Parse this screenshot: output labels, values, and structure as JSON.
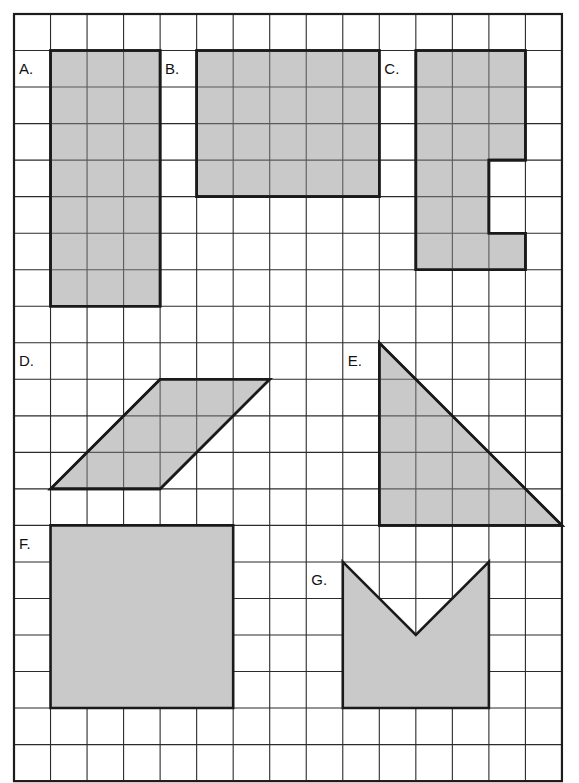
{
  "worksheet": {
    "title": "Area of shapes on a grid worksheet",
    "background_color": "#ffffff",
    "shape_fill_color": "#c9c9c9",
    "shape_stroke_color": "#1a1a1a",
    "grid_line_color": "#2b2b2b",
    "grid_border_color": "#1c1c1c"
  },
  "grid": {
    "origin_x": 14,
    "origin_y": 14,
    "cell_size": 36.53,
    "columns": 15,
    "rows": 21,
    "width": 548,
    "height": 767
  },
  "shapes": [
    {
      "id": "shape-a",
      "label": "A.",
      "label_cell": {
        "col": 0,
        "row": 1
      },
      "type": "rectangle",
      "description": "3 wide by 7 tall rectangle",
      "width_cells": 3,
      "height_cells": 7,
      "area_cells": 21,
      "show_inner_grid": true,
      "points": [
        [
          1,
          1
        ],
        [
          4,
          1
        ],
        [
          4,
          8
        ],
        [
          1,
          8
        ]
      ]
    },
    {
      "id": "shape-b",
      "label": "B.",
      "label_cell": {
        "col": 4,
        "row": 1
      },
      "type": "rectangle",
      "description": "5 wide by 4 tall rectangle",
      "width_cells": 5,
      "height_cells": 4,
      "area_cells": 20,
      "show_inner_grid": true,
      "points": [
        [
          5,
          1
        ],
        [
          10,
          1
        ],
        [
          10,
          5
        ],
        [
          5,
          5
        ]
      ]
    },
    {
      "id": "shape-c",
      "label": "C.",
      "label_cell": {
        "col": 10,
        "row": 1
      },
      "type": "polygon",
      "description": "C-shaped polygon, 3 wide, 6 tall with a notch on the right",
      "area_cells": 16,
      "show_inner_grid": true,
      "points": [
        [
          11,
          1
        ],
        [
          14,
          1
        ],
        [
          14,
          4
        ],
        [
          13,
          4
        ],
        [
          13,
          6
        ],
        [
          14,
          6
        ],
        [
          14,
          7
        ],
        [
          11,
          7
        ]
      ]
    },
    {
      "id": "shape-d",
      "label": "D.",
      "label_cell": {
        "col": 0,
        "row": 9
      },
      "type": "parallelogram",
      "description": "Parallelogram, base 3, height 3, slanted right",
      "base_cells": 3,
      "height_cells": 3,
      "area_cells": 9,
      "show_inner_grid": true,
      "points": [
        [
          1,
          13
        ],
        [
          4,
          13
        ],
        [
          7,
          10
        ],
        [
          4,
          10
        ]
      ]
    },
    {
      "id": "shape-e",
      "label": "E.",
      "label_cell": {
        "col": 9,
        "row": 9
      },
      "type": "right-triangle",
      "description": "Right triangle, base 5, height 5, right angle at bottom left",
      "base_cells": 5,
      "height_cells": 5,
      "area_cells": 12.5,
      "show_inner_grid": true,
      "points": [
        [
          10,
          9
        ],
        [
          10,
          14
        ],
        [
          15,
          14
        ]
      ]
    },
    {
      "id": "shape-f",
      "label": "F.",
      "label_cell": {
        "col": 0,
        "row": 14
      },
      "type": "square",
      "description": "Solid square, 5 by 5, no inner grid lines",
      "width_cells": 5,
      "height_cells": 5,
      "area_cells": 25,
      "show_inner_grid": false,
      "points": [
        [
          1,
          14
        ],
        [
          6,
          14
        ],
        [
          6,
          19
        ],
        [
          1,
          19
        ]
      ]
    },
    {
      "id": "shape-g",
      "label": "G.",
      "label_cell": {
        "col": 8,
        "row": 15
      },
      "type": "chevron",
      "description": "Chevron with a V-shaped notch cut into the top edge",
      "width_cells": 4,
      "height_cells": 4,
      "area_cells": 14,
      "show_inner_grid": false,
      "points": [
        [
          9,
          15
        ],
        [
          11,
          17
        ],
        [
          13,
          15
        ],
        [
          13,
          19
        ],
        [
          9,
          19
        ]
      ]
    }
  ]
}
